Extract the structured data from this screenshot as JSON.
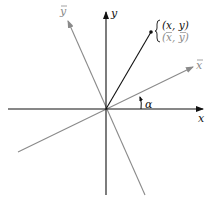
{
  "diagram": {
    "colors": {
      "primary": "#111111",
      "rotated": "#8a8a8a"
    },
    "labels": {
      "x_axis": "x",
      "y_axis": "y",
      "x_bar_axis": "x",
      "y_bar_axis": "y",
      "angle": "α",
      "point_original": "(x, y)",
      "point_rotated": "(x, y)"
    }
  }
}
